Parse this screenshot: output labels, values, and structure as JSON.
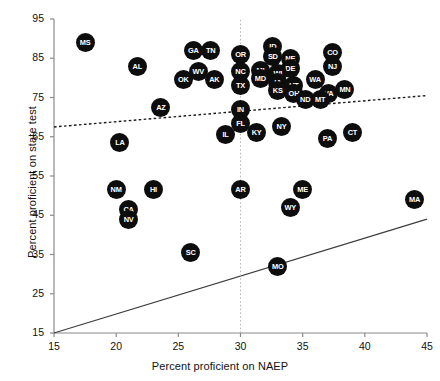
{
  "chart_data": {
    "type": "scatter",
    "title": "",
    "xlabel": "Percent proficient on NAEP",
    "ylabel": "Percent proficient on state test",
    "xlim": [
      15,
      45
    ],
    "ylim": [
      15,
      95
    ],
    "xticks": [
      15,
      20,
      25,
      30,
      35,
      40,
      45
    ],
    "yticks": [
      15,
      25,
      35,
      45,
      55,
      65,
      75,
      85,
      95
    ],
    "grid": false,
    "legend": null,
    "point_label_key": "state abbreviation",
    "marker_color": "#0d0d0d",
    "marker_text_color": "#ffffff",
    "points": [
      {
        "label": "MS",
        "x": 17.5,
        "y": 89.0
      },
      {
        "label": "AL",
        "x": 21.7,
        "y": 83.0
      },
      {
        "label": "GA",
        "x": 26.2,
        "y": 87.0
      },
      {
        "label": "TN",
        "x": 27.6,
        "y": 87.0
      },
      {
        "label": "OR",
        "x": 30.0,
        "y": 86.0
      },
      {
        "label": "OK",
        "x": 25.4,
        "y": 79.5
      },
      {
        "label": "WV",
        "x": 26.6,
        "y": 81.5
      },
      {
        "label": "AK",
        "x": 27.9,
        "y": 79.5
      },
      {
        "label": "NC",
        "x": 30.0,
        "y": 81.5
      },
      {
        "label": "TX",
        "x": 30.0,
        "y": 78.0
      },
      {
        "label": "ID",
        "x": 32.6,
        "y": 88.0
      },
      {
        "label": "SD",
        "x": 32.6,
        "y": 85.5
      },
      {
        "label": "NE",
        "x": 34.0,
        "y": 85.0
      },
      {
        "label": "DE",
        "x": 34.0,
        "y": 82.5
      },
      {
        "label": "CO",
        "x": 37.4,
        "y": 86.5
      },
      {
        "label": "MI",
        "x": 31.6,
        "y": 82.0
      },
      {
        "label": "MD",
        "x": 31.6,
        "y": 79.8
      },
      {
        "label": "WI",
        "x": 33.0,
        "y": 81.0
      },
      {
        "label": "IA",
        "x": 33.0,
        "y": 78.8
      },
      {
        "label": "KS",
        "x": 33.0,
        "y": 76.8
      },
      {
        "label": "UT",
        "x": 34.3,
        "y": 78.0
      },
      {
        "label": "OH",
        "x": 34.3,
        "y": 76.0
      },
      {
        "label": "NJ",
        "x": 37.4,
        "y": 83.0
      },
      {
        "label": "WA",
        "x": 36.0,
        "y": 79.5
      },
      {
        "label": "VA",
        "x": 37.1,
        "y": 76.0
      },
      {
        "label": "MN",
        "x": 38.4,
        "y": 77.0
      },
      {
        "label": "ND",
        "x": 35.2,
        "y": 74.5
      },
      {
        "label": "MT",
        "x": 36.4,
        "y": 74.5
      },
      {
        "label": "AZ",
        "x": 23.6,
        "y": 72.5
      },
      {
        "label": "IN",
        "x": 30.0,
        "y": 72.0
      },
      {
        "label": "FL",
        "x": 30.0,
        "y": 68.5
      },
      {
        "label": "IL",
        "x": 28.8,
        "y": 65.5
      },
      {
        "label": "KY",
        "x": 31.3,
        "y": 66.0
      },
      {
        "label": "NY",
        "x": 33.3,
        "y": 67.5
      },
      {
        "label": "PA",
        "x": 37.0,
        "y": 64.5
      },
      {
        "label": "CT",
        "x": 39.0,
        "y": 66.0
      },
      {
        "label": "LA",
        "x": 20.3,
        "y": 63.5
      },
      {
        "label": "NM",
        "x": 20.0,
        "y": 51.5
      },
      {
        "label": "CA",
        "x": 21.0,
        "y": 46.5
      },
      {
        "label": "NV",
        "x": 21.0,
        "y": 44.0
      },
      {
        "label": "HI",
        "x": 23.0,
        "y": 51.5
      },
      {
        "label": "AR",
        "x": 30.0,
        "y": 51.5
      },
      {
        "label": "ME",
        "x": 35.0,
        "y": 51.5
      },
      {
        "label": "WY",
        "x": 34.0,
        "y": 47.0
      },
      {
        "label": "MA",
        "x": 44.0,
        "y": 49.0
      },
      {
        "label": "SC",
        "x": 26.0,
        "y": 35.5
      },
      {
        "label": "MO",
        "x": 33.0,
        "y": 32.0
      }
    ],
    "reference_lines": [
      {
        "name": "identity-line",
        "style": "solid",
        "color": "#3c3c3c",
        "x0": 15,
        "y0": 15,
        "x1": 45,
        "y1": 44.0
      },
      {
        "name": "regression-line",
        "style": "dotted",
        "color": "#1a1a1a",
        "x0": 15,
        "y0": 67.5,
        "x1": 45,
        "y1": 75.5
      },
      {
        "name": "naep-30-vertical-line",
        "style": "dotted-vertical",
        "color": "#b8b8b8",
        "x0": 30,
        "y0": 15,
        "x1": 30,
        "y1": 95
      }
    ]
  }
}
